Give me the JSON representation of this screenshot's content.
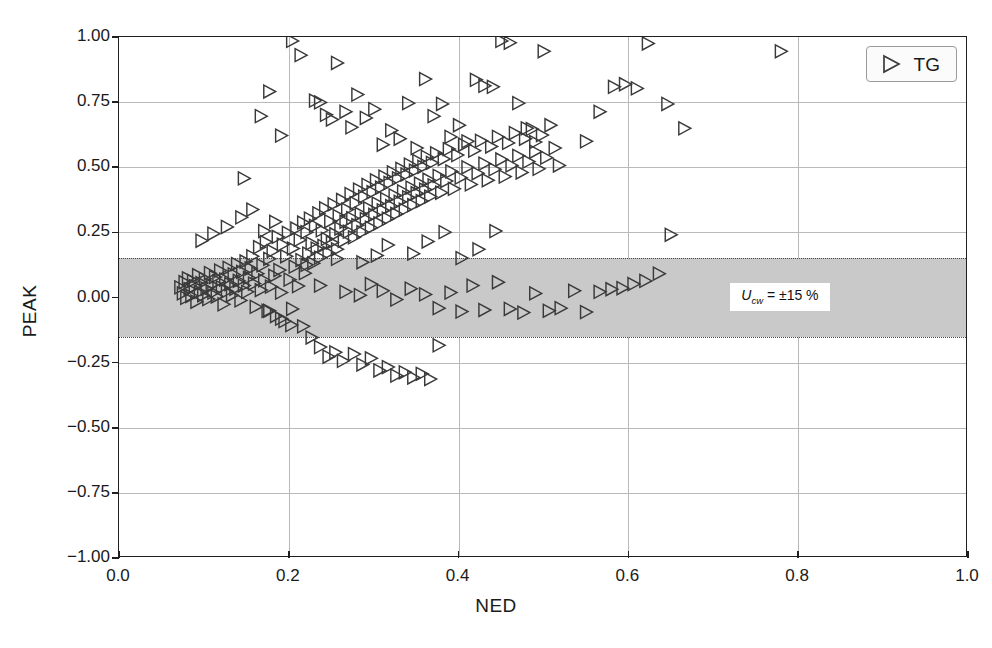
{
  "chart_data": {
    "type": "scatter",
    "title": "",
    "xlabel": "NED",
    "ylabel": "PEAK",
    "xlim": [
      0.0,
      1.0
    ],
    "ylim": [
      -1.0,
      1.0
    ],
    "xticks": [
      "0.0",
      "0.2",
      "0.4",
      "0.6",
      "0.8",
      "1.0"
    ],
    "xtick_values": [
      0.0,
      0.2,
      0.4,
      0.6,
      0.8,
      1.0
    ],
    "yticks": [
      "1.00",
      "0.75",
      "0.50",
      "0.25",
      "0.00",
      "-0.25",
      "-0.50",
      "-0.75",
      "-1.00"
    ],
    "ytick_values": [
      1.0,
      0.75,
      0.5,
      0.25,
      0.0,
      -0.25,
      -0.5,
      -0.75,
      -1.0
    ],
    "grid": true,
    "legend": {
      "position": "top-right",
      "entries": [
        {
          "label": "TG",
          "marker": "right-triangle-open",
          "color": "#3a3a3a"
        }
      ]
    },
    "bands": [
      {
        "label": "U_cw = ±15 %",
        "label_plain": "Ucw = ±15 %",
        "symbol": "U",
        "subscript": "cw",
        "equals": "= ±15 %",
        "ymin": -0.15,
        "ymax": 0.15,
        "color": "#c9c9c9",
        "edge_style": "dotted"
      }
    ],
    "series": [
      {
        "name": "TG",
        "marker": "right-triangle-open",
        "color": "#3a3a3a",
        "points": [
          [
            0.073,
            0.035
          ],
          [
            0.076,
            0.012
          ],
          [
            0.078,
            0.055
          ],
          [
            0.08,
            -0.005
          ],
          [
            0.082,
            0.07
          ],
          [
            0.084,
            0.028
          ],
          [
            0.086,
            0.002
          ],
          [
            0.088,
            0.06
          ],
          [
            0.09,
            0.04
          ],
          [
            0.092,
            -0.02
          ],
          [
            0.094,
            0.082
          ],
          [
            0.096,
            0.018
          ],
          [
            0.098,
            0.052
          ],
          [
            0.1,
            0.005
          ],
          [
            0.102,
            0.068
          ],
          [
            0.104,
            0.03
          ],
          [
            0.106,
            -0.01
          ],
          [
            0.108,
            0.09
          ],
          [
            0.11,
            0.045
          ],
          [
            0.112,
            0.015
          ],
          [
            0.114,
            0.075
          ],
          [
            0.116,
            0.0
          ],
          [
            0.118,
            0.058
          ],
          [
            0.12,
            0.1
          ],
          [
            0.122,
            0.035
          ],
          [
            0.124,
            -0.03
          ],
          [
            0.126,
            0.065
          ],
          [
            0.128,
            0.02
          ],
          [
            0.13,
            0.11
          ],
          [
            0.132,
            0.048
          ],
          [
            0.134,
            0.005
          ],
          [
            0.136,
            0.085
          ],
          [
            0.138,
            0.03
          ],
          [
            0.14,
            0.125
          ],
          [
            0.142,
            0.06
          ],
          [
            0.144,
            -0.015
          ],
          [
            0.146,
            0.095
          ],
          [
            0.148,
            0.042
          ],
          [
            0.15,
            0.135
          ],
          [
            0.152,
            0.018
          ],
          [
            0.154,
            0.072
          ],
          [
            0.156,
            0.108
          ],
          [
            0.158,
            0.155
          ],
          [
            0.16,
            0.05
          ],
          [
            0.162,
            -0.04
          ],
          [
            0.164,
            0.088
          ],
          [
            0.166,
            0.19
          ],
          [
            0.168,
            0.025
          ],
          [
            0.17,
            0.12
          ],
          [
            0.172,
            0.062
          ],
          [
            0.174,
            0.21
          ],
          [
            0.176,
            -0.055
          ],
          [
            0.178,
            0.145
          ],
          [
            0.18,
            0.038
          ],
          [
            0.182,
            0.175
          ],
          [
            0.184,
            0.08
          ],
          [
            0.186,
            -0.075
          ],
          [
            0.188,
            0.23
          ],
          [
            0.19,
            0.102
          ],
          [
            0.192,
            0.015
          ],
          [
            0.194,
            0.2
          ],
          [
            0.196,
            -0.095
          ],
          [
            0.198,
            0.155
          ],
          [
            0.2,
            0.245
          ],
          [
            0.202,
            0.065
          ],
          [
            0.204,
            -0.11
          ],
          [
            0.206,
            0.185
          ],
          [
            0.208,
            0.115
          ],
          [
            0.21,
            0.262
          ],
          [
            0.212,
            0.04
          ],
          [
            0.214,
            0.218
          ],
          [
            0.216,
            0.14
          ],
          [
            0.218,
            0.285
          ],
          [
            0.22,
            0.09
          ],
          [
            0.222,
            0.248
          ],
          [
            0.224,
            0.165
          ],
          [
            0.226,
            0.3
          ],
          [
            0.228,
            0.205
          ],
          [
            0.23,
            0.128
          ],
          [
            0.232,
            0.272
          ],
          [
            0.234,
            0.185
          ],
          [
            0.236,
            0.32
          ],
          [
            0.238,
            0.15
          ],
          [
            0.24,
            0.255
          ],
          [
            0.242,
            0.195
          ],
          [
            0.244,
            0.34
          ],
          [
            0.246,
            0.222
          ],
          [
            0.248,
            0.168
          ],
          [
            0.25,
            0.29
          ],
          [
            0.252,
            0.208
          ],
          [
            0.254,
            0.355
          ],
          [
            0.256,
            0.24
          ],
          [
            0.258,
            0.182
          ],
          [
            0.26,
            0.31
          ],
          [
            0.262,
            0.262
          ],
          [
            0.264,
            0.372
          ],
          [
            0.266,
            0.215
          ],
          [
            0.268,
            0.288
          ],
          [
            0.27,
            0.335
          ],
          [
            0.272,
            0.25
          ],
          [
            0.274,
            0.395
          ],
          [
            0.276,
            0.302
          ],
          [
            0.278,
            0.228
          ],
          [
            0.28,
            0.36
          ],
          [
            0.282,
            0.275
          ],
          [
            0.284,
            0.412
          ],
          [
            0.286,
            0.318
          ],
          [
            0.288,
            0.248
          ],
          [
            0.29,
            0.385
          ],
          [
            0.292,
            0.298
          ],
          [
            0.294,
            0.43
          ],
          [
            0.296,
            0.34
          ],
          [
            0.298,
            0.265
          ],
          [
            0.3,
            0.402
          ],
          [
            0.302,
            0.315
          ],
          [
            0.304,
            0.448
          ],
          [
            0.306,
            0.358
          ],
          [
            0.308,
            0.282
          ],
          [
            0.31,
            0.42
          ],
          [
            0.312,
            0.332
          ],
          [
            0.314,
            0.462
          ],
          [
            0.316,
            0.375
          ],
          [
            0.318,
            0.3
          ],
          [
            0.32,
            0.438
          ],
          [
            0.322,
            0.348
          ],
          [
            0.324,
            0.478
          ],
          [
            0.326,
            0.39
          ],
          [
            0.328,
            0.318
          ],
          [
            0.33,
            0.455
          ],
          [
            0.332,
            0.365
          ],
          [
            0.334,
            0.492
          ],
          [
            0.336,
            0.405
          ],
          [
            0.338,
            0.335
          ],
          [
            0.34,
            0.47
          ],
          [
            0.342,
            0.382
          ],
          [
            0.344,
            0.508
          ],
          [
            0.346,
            0.42
          ],
          [
            0.348,
            0.352
          ],
          [
            0.35,
            0.485
          ],
          [
            0.352,
            0.398
          ],
          [
            0.354,
            0.522
          ],
          [
            0.356,
            0.435
          ],
          [
            0.358,
            0.368
          ],
          [
            0.36,
            0.5
          ],
          [
            0.362,
            0.412
          ],
          [
            0.364,
            0.538
          ],
          [
            0.366,
            0.45
          ],
          [
            0.368,
            0.385
          ],
          [
            0.37,
            0.515
          ],
          [
            0.372,
            0.428
          ],
          [
            0.375,
            0.552
          ],
          [
            0.378,
            0.465
          ],
          [
            0.381,
            0.4
          ],
          [
            0.384,
            0.53
          ],
          [
            0.387,
            0.445
          ],
          [
            0.39,
            0.568
          ],
          [
            0.393,
            0.482
          ],
          [
            0.396,
            0.415
          ],
          [
            0.4,
            0.545
          ],
          [
            0.404,
            0.458
          ],
          [
            0.408,
            0.585
          ],
          [
            0.412,
            0.498
          ],
          [
            0.416,
            0.432
          ],
          [
            0.42,
            0.562
          ],
          [
            0.424,
            0.475
          ],
          [
            0.428,
            0.6
          ],
          [
            0.432,
            0.512
          ],
          [
            0.436,
            0.448
          ],
          [
            0.44,
            0.578
          ],
          [
            0.444,
            0.49
          ],
          [
            0.448,
            0.615
          ],
          [
            0.452,
            0.528
          ],
          [
            0.456,
            0.462
          ],
          [
            0.46,
            0.592
          ],
          [
            0.464,
            0.505
          ],
          [
            0.468,
            0.63
          ],
          [
            0.472,
            0.542
          ],
          [
            0.476,
            0.478
          ],
          [
            0.48,
            0.608
          ],
          [
            0.484,
            0.52
          ],
          [
            0.488,
            0.645
          ],
          [
            0.492,
            0.558
          ],
          [
            0.496,
            0.492
          ],
          [
            0.5,
            0.622
          ],
          [
            0.505,
            0.535
          ],
          [
            0.51,
            0.66
          ],
          [
            0.515,
            0.572
          ],
          [
            0.52,
            0.505
          ],
          [
            0.098,
            0.215
          ],
          [
            0.112,
            0.242
          ],
          [
            0.128,
            0.268
          ],
          [
            0.145,
            0.305
          ],
          [
            0.158,
            0.335
          ],
          [
            0.172,
            0.252
          ],
          [
            0.185,
            0.288
          ],
          [
            0.148,
            0.455
          ],
          [
            0.168,
            0.695
          ],
          [
            0.178,
            0.79
          ],
          [
            0.192,
            0.62
          ],
          [
            0.205,
            0.985
          ],
          [
            0.215,
            0.93
          ],
          [
            0.232,
            0.755
          ],
          [
            0.238,
            0.748
          ],
          [
            0.245,
            0.7
          ],
          [
            0.252,
            0.682
          ],
          [
            0.258,
            0.9
          ],
          [
            0.268,
            0.712
          ],
          [
            0.275,
            0.652
          ],
          [
            0.282,
            0.778
          ],
          [
            0.292,
            0.688
          ],
          [
            0.302,
            0.722
          ],
          [
            0.312,
            0.585
          ],
          [
            0.322,
            0.64
          ],
          [
            0.332,
            0.608
          ],
          [
            0.342,
            0.745
          ],
          [
            0.352,
            0.572
          ],
          [
            0.362,
            0.838
          ],
          [
            0.372,
            0.695
          ],
          [
            0.382,
            0.742
          ],
          [
            0.392,
            0.615
          ],
          [
            0.402,
            0.66
          ],
          [
            0.412,
            0.598
          ],
          [
            0.422,
            0.835
          ],
          [
            0.432,
            0.812
          ],
          [
            0.442,
            0.808
          ],
          [
            0.452,
            0.985
          ],
          [
            0.462,
            0.978
          ],
          [
            0.472,
            0.745
          ],
          [
            0.482,
            0.648
          ],
          [
            0.492,
            0.595
          ],
          [
            0.502,
            0.945
          ],
          [
            0.178,
            -0.055
          ],
          [
            0.192,
            -0.085
          ],
          [
            0.205,
            -0.048
          ],
          [
            0.218,
            -0.115
          ],
          [
            0.228,
            -0.158
          ],
          [
            0.238,
            -0.195
          ],
          [
            0.248,
            -0.232
          ],
          [
            0.256,
            -0.215
          ],
          [
            0.265,
            -0.248
          ],
          [
            0.278,
            -0.222
          ],
          [
            0.288,
            -0.262
          ],
          [
            0.298,
            -0.238
          ],
          [
            0.308,
            -0.285
          ],
          [
            0.318,
            -0.272
          ],
          [
            0.328,
            -0.305
          ],
          [
            0.338,
            -0.292
          ],
          [
            0.348,
            -0.312
          ],
          [
            0.358,
            -0.298
          ],
          [
            0.368,
            -0.318
          ],
          [
            0.378,
            -0.188
          ],
          [
            0.238,
            0.042
          ],
          [
            0.268,
            0.018
          ],
          [
            0.285,
            0.005
          ],
          [
            0.298,
            0.048
          ],
          [
            0.312,
            0.022
          ],
          [
            0.328,
            -0.012
          ],
          [
            0.345,
            0.03
          ],
          [
            0.362,
            0.008
          ],
          [
            0.378,
            -0.045
          ],
          [
            0.392,
            0.015
          ],
          [
            0.405,
            -0.058
          ],
          [
            0.418,
            0.042
          ],
          [
            0.432,
            -0.052
          ],
          [
            0.448,
            0.055
          ],
          [
            0.462,
            -0.048
          ],
          [
            0.478,
            -0.062
          ],
          [
            0.492,
            0.012
          ],
          [
            0.508,
            -0.055
          ],
          [
            0.522,
            -0.045
          ],
          [
            0.538,
            0.022
          ],
          [
            0.552,
            -0.06
          ],
          [
            0.568,
            0.018
          ],
          [
            0.582,
            0.028
          ],
          [
            0.595,
            0.032
          ],
          [
            0.608,
            0.048
          ],
          [
            0.622,
            0.06
          ],
          [
            0.638,
            0.088
          ],
          [
            0.652,
            0.238
          ],
          [
            0.318,
            0.198
          ],
          [
            0.348,
            0.165
          ],
          [
            0.365,
            0.212
          ],
          [
            0.385,
            0.248
          ],
          [
            0.405,
            0.148
          ],
          [
            0.425,
            0.182
          ],
          [
            0.445,
            0.252
          ],
          [
            0.288,
            0.132
          ],
          [
            0.305,
            0.158
          ],
          [
            0.258,
            0.145
          ],
          [
            0.222,
            0.122
          ],
          [
            0.552,
            0.598
          ],
          [
            0.568,
            0.712
          ],
          [
            0.585,
            0.808
          ],
          [
            0.598,
            0.818
          ],
          [
            0.612,
            0.802
          ],
          [
            0.625,
            0.975
          ],
          [
            0.648,
            0.742
          ],
          [
            0.668,
            0.648
          ],
          [
            0.782,
            0.945
          ]
        ]
      }
    ]
  }
}
